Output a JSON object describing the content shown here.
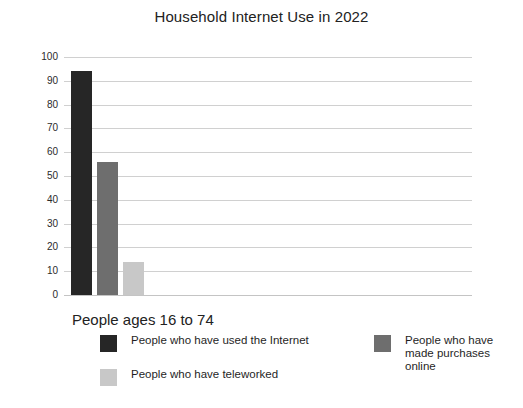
{
  "chart_data": {
    "type": "bar",
    "title": "Household Internet Use in 2022",
    "xlabel": "People ages 16 to 74",
    "ylabel": "",
    "categories": [
      "People ages 16 to 74"
    ],
    "series": [
      {
        "name": "People who have used the Internet",
        "values": [
          94
        ],
        "color": "#262626"
      },
      {
        "name": "People who have made purchases online",
        "values": [
          56
        ],
        "color": "#6e6e6e"
      },
      {
        "name": "People who have teleworked",
        "values": [
          14
        ],
        "color": "#c8c8c8"
      }
    ],
    "ylim": [
      0,
      100
    ],
    "yticks": [
      0,
      10,
      20,
      30,
      40,
      50,
      60,
      70,
      80,
      90,
      100
    ],
    "ytick_labels": [
      "0",
      "10",
      "20",
      "30",
      "40",
      "50",
      "60",
      "70",
      "80",
      "90",
      "100"
    ],
    "grid": true,
    "legend_position": "bottom",
    "legend": [
      {
        "label": "People who have used the Internet",
        "color": "#262626"
      },
      {
        "label": "People who have teleworked",
        "color": "#c8c8c8"
      },
      {
        "label": "People who have\nmade purchases\nonline",
        "color": "#6e6e6e"
      }
    ],
    "bars": [
      {
        "label": "People who have used the Internet",
        "value": 94,
        "color": "#262626"
      },
      {
        "label": "People who have made purchases online",
        "value": 56,
        "color": "#6e6e6e"
      },
      {
        "label": "People who have teleworked",
        "value": 14,
        "color": "#c8c8c8"
      }
    ],
    "colors": {
      "gridline": "#d0d0d0",
      "background": "#ffffff",
      "text": "#1f1f1f"
    }
  }
}
